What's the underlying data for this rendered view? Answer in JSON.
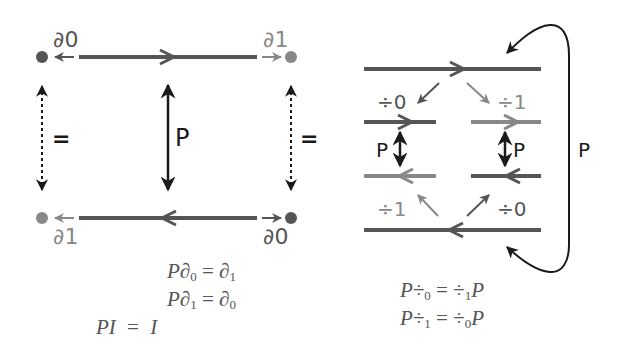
{
  "colors": {
    "dark": "#555555",
    "light": "#888888",
    "black": "#1a1a1a",
    "background": "#ffffff"
  },
  "left_diagram": {
    "labels": {
      "top_left": "∂0",
      "top_right": "∂1",
      "bottom_left": "∂1",
      "bottom_right": "∂0",
      "center_arrow": "P",
      "left_equal": "=",
      "right_equal": "="
    },
    "equations": [
      {
        "lhs": "P∂",
        "lhs_sub": "0",
        "rhs": "∂",
        "rhs_sub": "1"
      },
      {
        "lhs": "P∂",
        "lhs_sub": "1",
        "rhs": "∂",
        "rhs_sub": "0"
      },
      {
        "lhs": "PI",
        "lhs_sub": "",
        "rhs": "I",
        "rhs_sub": ""
      }
    ]
  },
  "right_diagram": {
    "labels": {
      "top_left_face": "÷0",
      "top_right_face": "÷1",
      "bottom_left_face": "÷1",
      "bottom_right_face": "÷0",
      "left_swap": "P",
      "right_swap": "P",
      "outer_curve": "P"
    },
    "equations": [
      {
        "lhs": "P÷",
        "lhs_sub": "0",
        "rhs": "÷",
        "rhs_sub": "1",
        "rhs_tail": "P"
      },
      {
        "lhs": "P÷",
        "lhs_sub": "1",
        "rhs": "÷",
        "rhs_sub": "0",
        "rhs_tail": "P"
      }
    ]
  },
  "equals_sign": "="
}
